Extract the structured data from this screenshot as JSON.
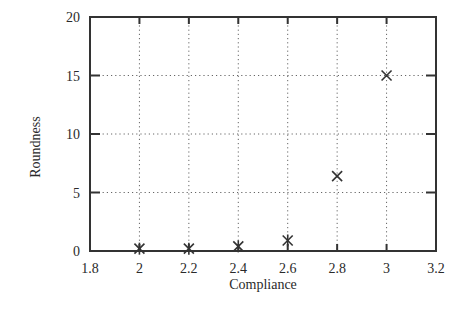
{
  "chart_data": {
    "type": "scatter",
    "title": "",
    "xlabel": "Compliance",
    "ylabel": "Roundness",
    "xlim": [
      1.8,
      3.2
    ],
    "ylim": [
      0,
      20
    ],
    "xticks": [
      1.8,
      2,
      2.2,
      2.4,
      2.6,
      2.8,
      3,
      3.2
    ],
    "xtick_labels": [
      "1.8",
      "2",
      "2.2",
      "2.4",
      "2.6",
      "2.8",
      "3",
      "3.2"
    ],
    "yticks": [
      0,
      5,
      10,
      15,
      20
    ],
    "ytick_labels": [
      "0",
      "5",
      "10",
      "15",
      "20"
    ],
    "grid": true,
    "grid_style": "dotted",
    "legend": null,
    "series": [
      {
        "name": "Roundness vs Compliance",
        "marker": "star-x",
        "x": [
          2.0,
          2.2,
          2.4,
          2.6,
          2.8,
          3.0
        ],
        "y": [
          0.2,
          0.2,
          0.4,
          0.9,
          6.4,
          15.0
        ]
      }
    ]
  },
  "layout": {
    "plot_left": 90,
    "plot_right": 436,
    "plot_top": 17,
    "plot_bottom": 251
  },
  "colors": {
    "axis": "#333333",
    "grid": "#666666",
    "text": "#2a2a2a",
    "background": "#ffffff"
  }
}
